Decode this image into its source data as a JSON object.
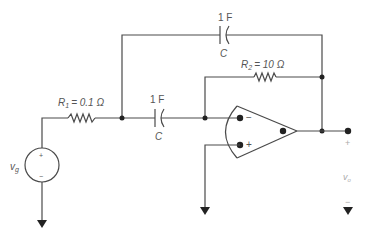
{
  "circuit": {
    "r1": {
      "symbol": "R",
      "subscript": "1",
      "value": "= 0.1 Ω"
    },
    "r2": {
      "symbol": "R",
      "subscript": "2",
      "value": "= 10 Ω"
    },
    "c_top": {
      "value": "1 F",
      "name": "C"
    },
    "c_mid": {
      "value": "1 F",
      "name": "C"
    },
    "source": {
      "symbol": "v",
      "subscript": "g",
      "plus": "+",
      "minus": "−"
    },
    "opamp": {
      "minus": "−",
      "plus": "+"
    },
    "output": {
      "symbol": "v",
      "subscript": "o",
      "plus": "+",
      "minus": "−"
    }
  },
  "colors": {
    "wire": "#4a4a4a",
    "text": "#555555",
    "node": "#222222"
  }
}
